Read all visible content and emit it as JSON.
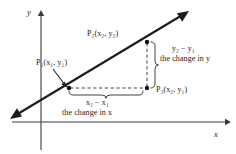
{
  "figure": {
    "background_color": "#ffffff",
    "ink_color": "#222222",
    "axes": {
      "x_label": "x",
      "y_label": "y",
      "x_axis": {
        "x1": 12,
        "y1": 122,
        "x2": 228,
        "y2": 122
      },
      "y_axis": {
        "x1": 41,
        "y1": 12,
        "x2": 41,
        "y2": 150
      }
    },
    "line": {
      "name": "secant-line",
      "x1": 11,
      "y1": 118,
      "x2": 189,
      "y2": 11,
      "double_arrow": true
    },
    "points": [
      {
        "id": "P1",
        "label": "P₁(x₁, y₁)",
        "cx": 69,
        "cy": 88
      },
      {
        "id": "P2",
        "label": "P₂(x₂, y₂)",
        "cx": 147,
        "cy": 42
      },
      {
        "id": "P3",
        "label": "P₃(x₂, y₁)",
        "cx": 147,
        "cy": 88
      }
    ],
    "dashed_rise": {
      "x": 147,
      "y1": 42,
      "y2": 88
    },
    "dashed_run": {
      "y": 88,
      "x1": 69,
      "x2": 147
    },
    "brace_vertical": {
      "x": 155,
      "y1": 42,
      "y2": 88
    },
    "brace_horizontal": {
      "y": 95,
      "x1": 69,
      "x2": 147
    },
    "pointer_arrow": {
      "x1": 55,
      "y1": 71,
      "x2": 67,
      "y2": 86
    }
  },
  "labels": {
    "p1": {
      "base": "P",
      "sub": "1",
      "args": "(x₁, y₁)",
      "text": "P₁(x₁, y₁)"
    },
    "p2": {
      "text": "P₂(x₂, y₂)"
    },
    "p3": {
      "text": "P₃(x₂, y₁)"
    },
    "delta_y": {
      "expression": "y₂ − y₁",
      "caption": "the change in y"
    },
    "delta_x": {
      "expression": "x₂ − x₁",
      "caption": "the change in x"
    },
    "axis_x": "x",
    "axis_y": "y"
  }
}
